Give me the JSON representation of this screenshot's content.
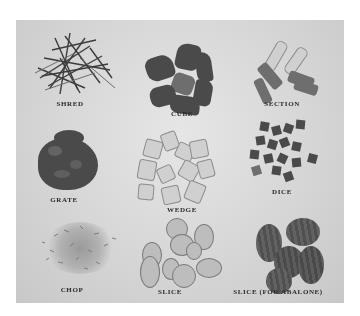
{
  "photo": {
    "description": "Black-and-white photograph showing nine vegetable cutting styles arranged in a 3x3 grid",
    "cuts": [
      {
        "label": "SHRED",
        "row": 0,
        "col": 0
      },
      {
        "label": "CUBE",
        "row": 0,
        "col": 1
      },
      {
        "label": "SECTION",
        "row": 0,
        "col": 2
      },
      {
        "label": "GRATE",
        "row": 1,
        "col": 0
      },
      {
        "label": "WEDGE",
        "row": 1,
        "col": 1
      },
      {
        "label": "DICE",
        "row": 1,
        "col": 2
      },
      {
        "label": "CHOP",
        "row": 2,
        "col": 0
      },
      {
        "label": "SLICE",
        "row": 2,
        "col": 1
      },
      {
        "label": "SLICE (FOR ABALONE)",
        "row": 2,
        "col": 2
      }
    ]
  }
}
